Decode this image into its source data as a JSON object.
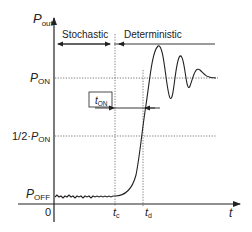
{
  "axes": {
    "y_label_main": "P",
    "y_label_sub": "out",
    "x_label": "t",
    "origin_label": "0"
  },
  "levels": {
    "p_on_main": "P",
    "p_on_sub": "ON",
    "half_prefix": "1/2·",
    "half_main": "P",
    "half_sub": "ON",
    "p_off_main": "P",
    "p_off_sub": "OFF"
  },
  "regions": {
    "stochastic": "Stochastic",
    "deterministic": "Deterministic"
  },
  "markers": {
    "tc_main": "t",
    "tc_sub": "c",
    "td_main": "t",
    "td_sub": "d",
    "ton_main": "t",
    "ton_sub": "ON"
  },
  "colors": {
    "line": "#222222",
    "grid": "#555555"
  }
}
